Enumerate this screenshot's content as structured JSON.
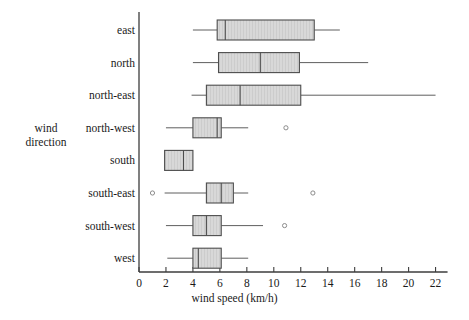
{
  "chart_data": {
    "type": "box",
    "title": "",
    "xlabel": "wind speed (km/h)",
    "ylabel": "wind direction",
    "ylabel_lines": [
      "wind",
      "direction"
    ],
    "orientation": "horizontal",
    "xlim": [
      0,
      22.9
    ],
    "xticks": [
      0,
      2,
      4,
      6,
      8,
      10,
      12,
      14,
      16,
      18,
      20,
      22
    ],
    "xtick_labels": [
      "0",
      "2",
      "4",
      "6",
      "8",
      "10",
      "12",
      "14",
      "16",
      "18",
      "20",
      "22"
    ],
    "grid": false,
    "legend": null,
    "categories": [
      "east",
      "north",
      "north-east",
      "north-west",
      "south",
      "south-east",
      "south-west",
      "west"
    ],
    "boxes": [
      {
        "category": "east",
        "whisker_low": 4.0,
        "q1": 5.8,
        "median": 6.4,
        "q3": 13.0,
        "whisker_high": 14.9,
        "outliers": []
      },
      {
        "category": "north",
        "whisker_low": 4.0,
        "q1": 5.9,
        "median": 9.0,
        "q3": 11.9,
        "whisker_high": 17.0,
        "outliers": []
      },
      {
        "category": "north-east",
        "whisker_low": 3.9,
        "q1": 5.0,
        "median": 7.5,
        "q3": 12.0,
        "whisker_high": 22.0,
        "outliers": []
      },
      {
        "category": "north-west",
        "whisker_low": 2.0,
        "q1": 4.0,
        "median": 5.8,
        "q3": 6.1,
        "whisker_high": 8.1,
        "outliers": [
          10.9
        ]
      },
      {
        "category": "south",
        "whisker_low": 1.9,
        "q1": 1.9,
        "median": 3.3,
        "q3": 4.0,
        "whisker_high": 4.0,
        "outliers": []
      },
      {
        "category": "south-east",
        "whisker_low": 1.9,
        "q1": 5.0,
        "median": 6.1,
        "q3": 7.0,
        "whisker_high": 8.1,
        "outliers": [
          1.0,
          12.9
        ]
      },
      {
        "category": "south-west",
        "whisker_low": 2.0,
        "q1": 4.0,
        "median": 5.0,
        "q3": 6.1,
        "whisker_high": 9.2,
        "outliers": [
          10.8
        ]
      },
      {
        "category": "west",
        "whisker_low": 2.1,
        "q1": 4.0,
        "median": 4.4,
        "q3": 6.1,
        "whisker_high": 8.1,
        "outliers": []
      }
    ],
    "colors": {
      "box_fill": "#d4d4d4",
      "box_edge": "#4d4d4d",
      "whisker": "#4d4d4d",
      "median": "#4d4d4d",
      "outlier_edge": "#808080",
      "axis": "#3c3c3c",
      "text": "#1a1a1a",
      "background": "#ffffff"
    }
  },
  "geometry": {
    "x_zero_px": 139,
    "px_per_unit": 13.48,
    "row_start_px": 30,
    "row_step_px": 32.6,
    "box_height_px": 20,
    "axis_top_px": 12,
    "axis_bottom_px": 272,
    "tick_len_px": 5,
    "label_right_px": 135
  }
}
